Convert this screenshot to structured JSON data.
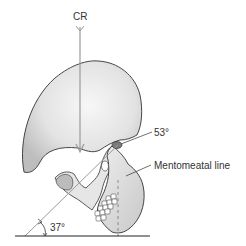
{
  "diagram": {
    "labels": {
      "central_ray": "CR",
      "upper_angle": "53°",
      "line_name": "Mentomeatal line",
      "lower_angle": "37°"
    },
    "colors": {
      "outline": "#333333",
      "line": "#9a9a9a",
      "baseline": "#222222",
      "skull_light": "#f2f2f2",
      "skull_shade": "#c4c4c4"
    }
  }
}
